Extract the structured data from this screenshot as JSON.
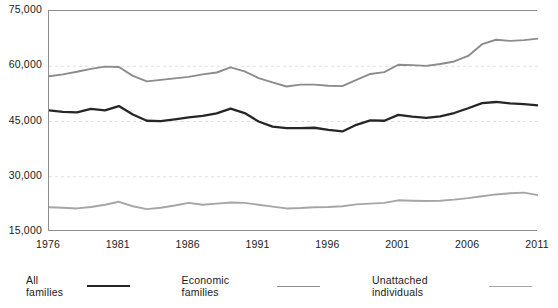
{
  "chart_data": {
    "type": "line",
    "title": "",
    "xlabel": "",
    "ylabel": "",
    "ylim": [
      15000,
      75000
    ],
    "xlim": [
      1976,
      2011
    ],
    "grid": true,
    "legend_position": "bottom",
    "y_ticks": [
      "75,000",
      "60,000",
      "45,000",
      "30,000",
      "15,000"
    ],
    "y_tick_values": [
      75000,
      60000,
      45000,
      30000,
      15000
    ],
    "x_ticks": [
      "1976",
      "1981",
      "1986",
      "1991",
      "1996",
      "2001",
      "2006",
      "2011"
    ],
    "x_tick_values": [
      1976,
      1981,
      1986,
      1991,
      1996,
      2001,
      2006,
      2011
    ],
    "x": [
      1976,
      1977,
      1978,
      1979,
      1980,
      1981,
      1982,
      1983,
      1984,
      1985,
      1986,
      1987,
      1988,
      1989,
      1990,
      1991,
      1992,
      1993,
      1994,
      1995,
      1996,
      1997,
      1998,
      1999,
      2000,
      2001,
      2002,
      2003,
      2004,
      2005,
      2006,
      2007,
      2008,
      2009,
      2010,
      2011
    ],
    "series": [
      {
        "name": "All families",
        "color": "#262626",
        "values": [
          48000,
          47600,
          47500,
          48400,
          48000,
          49200,
          46900,
          45200,
          45100,
          45600,
          46100,
          46500,
          47200,
          48500,
          47300,
          45000,
          43600,
          43200,
          43200,
          43300,
          42700,
          42300,
          44100,
          45300,
          45200,
          46800,
          46300,
          46000,
          46400,
          47300,
          48600,
          50000,
          50300,
          49900,
          49700,
          49400
        ]
      },
      {
        "name": "Economic families",
        "color": "#8c8c8c",
        "values": [
          57300,
          57800,
          58500,
          59300,
          59900,
          59800,
          57400,
          55900,
          56300,
          56700,
          57100,
          57800,
          58300,
          59700,
          58600,
          56800,
          55600,
          54500,
          55000,
          55000,
          54700,
          54600,
          56300,
          57900,
          58400,
          60400,
          60300,
          60100,
          60600,
          61300,
          62800,
          66000,
          67200,
          66900,
          67100,
          67500
        ]
      },
      {
        "name": "Unattached individuals",
        "color": "#a6a6a6",
        "values": [
          21700,
          21600,
          21400,
          21800,
          22400,
          23200,
          22000,
          21200,
          21600,
          22200,
          22900,
          22400,
          22700,
          23000,
          22900,
          22400,
          21900,
          21400,
          21500,
          21700,
          21800,
          22000,
          22500,
          22700,
          22900,
          23600,
          23500,
          23400,
          23500,
          23800,
          24200,
          24700,
          25200,
          25500,
          25700,
          25000
        ]
      }
    ]
  },
  "legend": {
    "items": [
      {
        "label": "All families",
        "color": "#262626"
      },
      {
        "label": "Economic families",
        "color": "#8c8c8c"
      },
      {
        "label": "Unattached individuals",
        "color": "#a6a6a6"
      }
    ]
  }
}
